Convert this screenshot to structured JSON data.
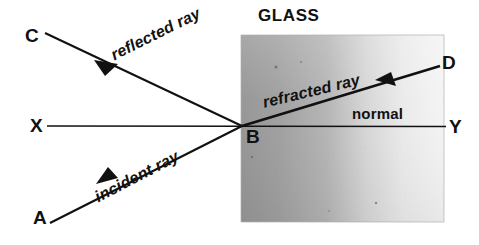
{
  "figure": {
    "title_label": "GLASS",
    "medium_label": "GLASS",
    "point_labels": {
      "C": "C",
      "A": "A",
      "X": "X",
      "Y": "Y",
      "D": "D",
      "B": "B"
    },
    "ray_labels": {
      "reflected": "reflected ray",
      "incident": "incident ray",
      "refracted": "refracted ray",
      "normal": "normal"
    },
    "colors": {
      "ink": "#111111",
      "background": "#ffffff",
      "glass_dark": "#9a9a9a",
      "glass_mid": "#c9c9c9",
      "glass_light": "#f2f2f2"
    },
    "geometry": {
      "incidence_point": "B",
      "interface_line": "X-Y",
      "incident_ray_path": "A to B",
      "reflected_ray_path": "B to C",
      "refracted_ray_path": "B to D",
      "glass_block": {
        "x": 241,
        "y": 35,
        "width": 203,
        "height": 187
      }
    }
  }
}
